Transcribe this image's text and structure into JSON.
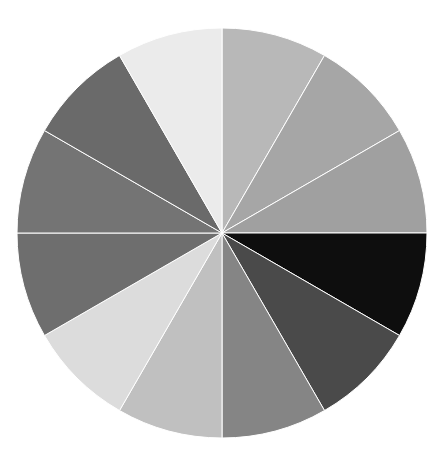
{
  "chart_data": {
    "type": "pie",
    "title": "",
    "legend": [],
    "start_angle_deg": 0,
    "direction": "clockwise",
    "center": [
      222,
      233
    ],
    "radius": 205,
    "separator_color": "#ffffff",
    "slices": [
      {
        "value": 30,
        "color": "#b8b8b8"
      },
      {
        "value": 30,
        "color": "#a6a6a6"
      },
      {
        "value": 30,
        "color": "#a0a0a0"
      },
      {
        "value": 30,
        "color": "#0e0e0e"
      },
      {
        "value": 30,
        "color": "#4a4a4a"
      },
      {
        "value": 30,
        "color": "#858585"
      },
      {
        "value": 30,
        "color": "#c0c0c0"
      },
      {
        "value": 30,
        "color": "#dcdcdc"
      },
      {
        "value": 30,
        "color": "#6e6e6e"
      },
      {
        "value": 30,
        "color": "#747474"
      },
      {
        "value": 30,
        "color": "#6a6a6a"
      },
      {
        "value": 30,
        "color": "#ebebeb"
      }
    ],
    "values": [
      30,
      30,
      30,
      30,
      30,
      30,
      30,
      30,
      30,
      30,
      30,
      30
    ],
    "categories": [
      "",
      "",
      "",
      "",
      "",
      "",
      "",
      "",
      "",
      "",
      "",
      ""
    ]
  }
}
